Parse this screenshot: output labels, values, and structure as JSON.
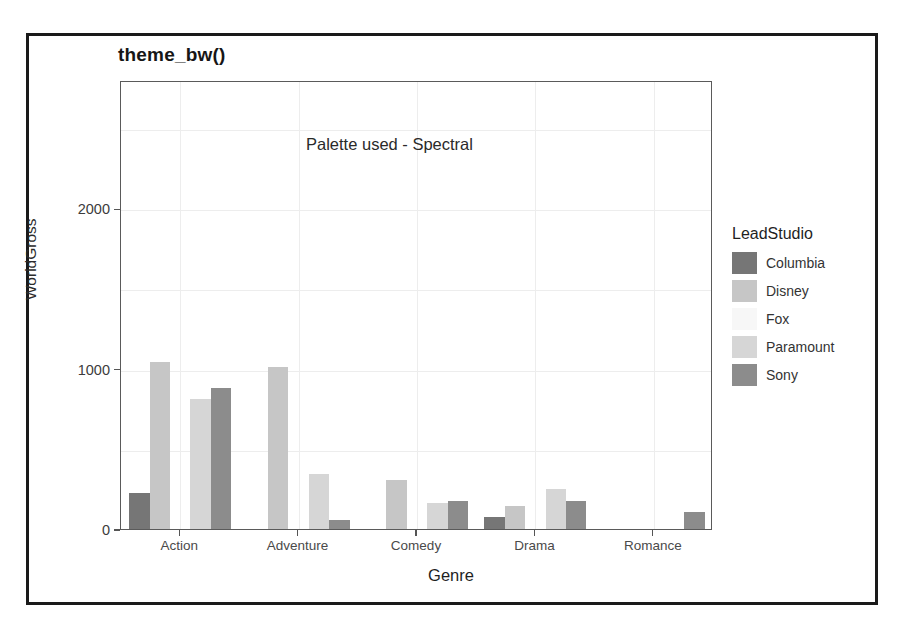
{
  "figure": {
    "title": "theme_bw()",
    "annotation": "Palette used - Spectral"
  },
  "legend": {
    "title": "LeadStudio",
    "entries": [
      {
        "label": "Columbia",
        "color": "#767676"
      },
      {
        "label": "Disney",
        "color": "#c6c6c6"
      },
      {
        "label": "Fox",
        "color": "#f7f7f7"
      },
      {
        "label": "Paramount",
        "color": "#d6d6d6"
      },
      {
        "label": "Sony",
        "color": "#8c8c8c"
      }
    ]
  },
  "chart_data": {
    "type": "bar",
    "title": "theme_bw()",
    "xlabel": "Genre",
    "ylabel": "WorldGross",
    "categories": [
      "Action",
      "Adventure",
      "Comedy",
      "Drama",
      "Romance"
    ],
    "yticks": [
      0,
      1000,
      2000
    ],
    "ylim": [
      0,
      2800
    ],
    "grid": true,
    "legend_position": "right",
    "legend_title": "LeadStudio",
    "annotation": "Palette used - Spectral",
    "series": [
      {
        "name": "Columbia",
        "color": "#767676",
        "values": [
          225,
          null,
          null,
          75,
          null
        ]
      },
      {
        "name": "Disney",
        "color": "#c6c6c6",
        "values": [
          1040,
          1010,
          305,
          145,
          null
        ]
      },
      {
        "name": "Fox",
        "color": "#f7f7f7",
        "values": [
          null,
          null,
          null,
          null,
          null
        ]
      },
      {
        "name": "Paramount",
        "color": "#d6d6d6",
        "values": [
          810,
          345,
          165,
          250,
          null
        ]
      },
      {
        "name": "Sony",
        "color": "#8c8c8c",
        "values": [
          880,
          55,
          175,
          175,
          105
        ]
      }
    ]
  }
}
